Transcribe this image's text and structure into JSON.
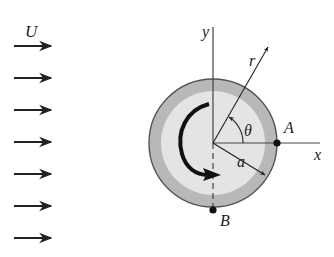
{
  "diagram": {
    "labels": {
      "freestream": "U",
      "y_axis": "y",
      "x_axis": "x",
      "radial": "r",
      "angle": "θ",
      "radius": "a",
      "point_a": "A",
      "point_b": "B"
    },
    "flow_arrows": {
      "count": 7,
      "x_start": 14,
      "x_end": 51,
      "y_positions": [
        46,
        78,
        110,
        142,
        174,
        206,
        238
      ]
    },
    "cylinder": {
      "center": [
        213,
        143
      ],
      "outer_radius": 64,
      "inner_radius": 52,
      "outer_color": "#b8b8b8",
      "inner_color": "#e4e4e4",
      "edge_color": "#555555",
      "rotation": "clockwise"
    },
    "colors": {
      "ink": "#222222",
      "axis": "#444444"
    }
  }
}
